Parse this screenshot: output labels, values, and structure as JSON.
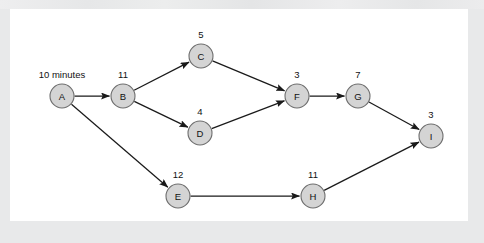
{
  "figure": {
    "kind": "activity-network-diagram",
    "panel_background": "#ffffff",
    "canvas_background": "#e8e9ea",
    "node_fill": "#d4d4d4",
    "node_stroke": "#6e6e6e",
    "edge_color": "#1a1a1a",
    "text_color": "#111111"
  },
  "nodes": [
    {
      "id": "A",
      "label": "A",
      "weight": "10 minutes",
      "cx": 62,
      "cy": 96,
      "r": 12,
      "weight_x": 62,
      "weight_y": 78
    },
    {
      "id": "B",
      "label": "B",
      "weight": "11",
      "cx": 123,
      "cy": 96,
      "r": 12,
      "weight_x": 123,
      "weight_y": 78
    },
    {
      "id": "C",
      "label": "C",
      "weight": "5",
      "cx": 201,
      "cy": 56,
      "r": 12,
      "weight_x": 201,
      "weight_y": 38
    },
    {
      "id": "D",
      "label": "D",
      "weight": "4",
      "cx": 200,
      "cy": 133,
      "r": 12,
      "weight_x": 200,
      "weight_y": 115
    },
    {
      "id": "E",
      "label": "E",
      "weight": "12",
      "cx": 178,
      "cy": 196,
      "r": 12,
      "weight_x": 178,
      "weight_y": 178
    },
    {
      "id": "F",
      "label": "F",
      "weight": "3",
      "cx": 297,
      "cy": 96,
      "r": 12,
      "weight_x": 297,
      "weight_y": 78
    },
    {
      "id": "G",
      "label": "G",
      "weight": "7",
      "cx": 358,
      "cy": 96,
      "r": 12,
      "weight_x": 358,
      "weight_y": 78
    },
    {
      "id": "H",
      "label": "H",
      "weight": "11",
      "cx": 313,
      "cy": 196,
      "r": 12,
      "weight_x": 313,
      "weight_y": 178
    },
    {
      "id": "I",
      "label": "I",
      "weight": "3",
      "cx": 431,
      "cy": 136,
      "r": 12,
      "weight_x": 431,
      "weight_y": 118
    }
  ],
  "edges": [
    {
      "from": "A",
      "to": "B"
    },
    {
      "from": "A",
      "to": "E"
    },
    {
      "from": "B",
      "to": "C"
    },
    {
      "from": "B",
      "to": "D"
    },
    {
      "from": "C",
      "to": "F"
    },
    {
      "from": "D",
      "to": "F"
    },
    {
      "from": "E",
      "to": "H"
    },
    {
      "from": "F",
      "to": "G"
    },
    {
      "from": "G",
      "to": "I"
    },
    {
      "from": "H",
      "to": "I"
    }
  ],
  "chart_data": {
    "type": "diagram",
    "title": "",
    "nodes": [
      "A",
      "B",
      "C",
      "D",
      "E",
      "F",
      "G",
      "H",
      "I"
    ],
    "node_weights": {
      "A": "10 minutes",
      "B": "11",
      "C": "5",
      "D": "4",
      "E": "12",
      "F": "3",
      "G": "7",
      "H": "11",
      "I": "3"
    },
    "edges": [
      [
        "A",
        "B"
      ],
      [
        "A",
        "E"
      ],
      [
        "B",
        "C"
      ],
      [
        "B",
        "D"
      ],
      [
        "C",
        "F"
      ],
      [
        "D",
        "F"
      ],
      [
        "E",
        "H"
      ],
      [
        "F",
        "G"
      ],
      [
        "G",
        "I"
      ],
      [
        "H",
        "I"
      ]
    ]
  }
}
